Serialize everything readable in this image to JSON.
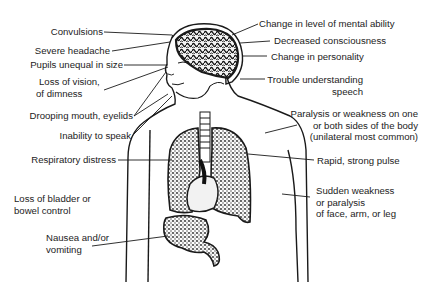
{
  "diagram": {
    "labels_left": [
      {
        "id": "convulsions",
        "text": "Convulsions"
      },
      {
        "id": "severe-headache",
        "text": "Severe headache"
      },
      {
        "id": "pupils-unequal",
        "text": "Pupils unequal in size"
      },
      {
        "id": "loss-of-vision",
        "lines": [
          "Loss of vision,",
          "of dimness"
        ]
      },
      {
        "id": "drooping-mouth",
        "text": "Drooping mouth, eyelids"
      },
      {
        "id": "inability-to-speak",
        "text": "Inability to speak"
      },
      {
        "id": "respiratory-distress",
        "text": "Respiratory distress"
      },
      {
        "id": "loss-of-bladder",
        "lines": [
          "Loss of bladder or",
          "bowel control"
        ]
      },
      {
        "id": "nausea",
        "lines": [
          "Nausea and/or",
          "vomiting"
        ]
      }
    ],
    "labels_right": [
      {
        "id": "change-mental-ability",
        "text": "Change in level of mental ability"
      },
      {
        "id": "decreased-consciousness",
        "text": "Decreased consciousness"
      },
      {
        "id": "change-personality",
        "text": "Change in personality"
      },
      {
        "id": "trouble-understanding",
        "lines": [
          "Trouble understanding",
          "speech"
        ]
      },
      {
        "id": "paralysis-one-side",
        "lines": [
          "Paralysis or weakness on one",
          "or both sides of the body",
          "(unilateral most common)"
        ]
      },
      {
        "id": "rapid-pulse",
        "text": "Rapid, strong pulse"
      },
      {
        "id": "sudden-weakness",
        "lines": [
          "Sudden weakness",
          "or paralysis",
          "of face, arm, or leg"
        ]
      }
    ],
    "colors": {
      "ink": "#1a1a1a",
      "background": "#ffffff",
      "organ_fill": "#6a6a6a"
    }
  }
}
